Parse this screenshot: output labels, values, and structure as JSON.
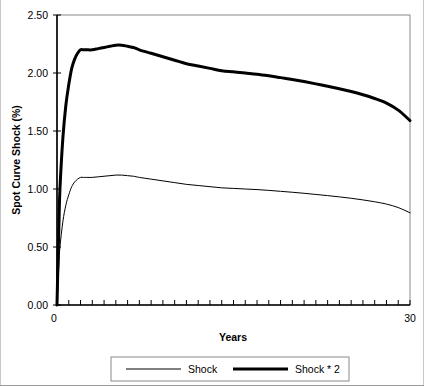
{
  "chart_data": {
    "type": "line",
    "title": "",
    "xlabel": "Years",
    "ylabel": "Spot Curve Shock (%)",
    "xlim": [
      0,
      30
    ],
    "ylim": [
      0,
      2.5
    ],
    "xticklabels": [
      "0",
      "30"
    ],
    "yticklabels": [
      "0.00",
      "0.50",
      "1.00",
      "1.50",
      "2.00",
      "2.50"
    ],
    "ytickvalues": [
      0,
      0.5,
      1.0,
      1.5,
      2.0,
      2.5
    ],
    "grid": false,
    "legend_position": "bottom",
    "x_minor_tick_interval": 1,
    "x": [
      0,
      0.08,
      0.17,
      0.25,
      0.5,
      0.75,
      1,
      1.25,
      1.5,
      1.75,
      2,
      2.25,
      2.5,
      3,
      3.5,
      4,
      4.5,
      5,
      5.5,
      6,
      6.5,
      7,
      8,
      9,
      10,
      11,
      12,
      13,
      14,
      15,
      16,
      17,
      18,
      19,
      20,
      21,
      22,
      23,
      24,
      25,
      26,
      27,
      28,
      29,
      30
    ],
    "series": [
      {
        "name": "Shock",
        "linewidth": 1,
        "color": "#000000",
        "values": [
          0.0,
          0.18,
          0.36,
          0.5,
          0.72,
          0.86,
          0.95,
          1.02,
          1.06,
          1.085,
          1.1,
          1.1,
          1.1,
          1.1,
          1.105,
          1.11,
          1.115,
          1.12,
          1.12,
          1.115,
          1.11,
          1.1,
          1.085,
          1.07,
          1.055,
          1.04,
          1.03,
          1.02,
          1.01,
          1.005,
          1.0,
          0.995,
          0.988,
          0.98,
          0.972,
          0.963,
          0.953,
          0.943,
          0.932,
          0.92,
          0.906,
          0.89,
          0.87,
          0.84,
          0.795
        ]
      },
      {
        "name": "Shock * 2",
        "linewidth": 3,
        "color": "#000000",
        "values": [
          0.0,
          0.36,
          0.72,
          1.0,
          1.44,
          1.72,
          1.9,
          2.04,
          2.12,
          2.17,
          2.2,
          2.2,
          2.2,
          2.2,
          2.21,
          2.22,
          2.23,
          2.24,
          2.24,
          2.23,
          2.22,
          2.2,
          2.17,
          2.14,
          2.11,
          2.08,
          2.06,
          2.04,
          2.02,
          2.01,
          2.0,
          1.99,
          1.976,
          1.96,
          1.944,
          1.926,
          1.906,
          1.886,
          1.864,
          1.84,
          1.812,
          1.78,
          1.74,
          1.68,
          1.59
        ]
      }
    ],
    "legend": [
      {
        "label": "Shock",
        "style": "thin-line"
      },
      {
        "label": "Shock * 2",
        "style": "thick-line"
      }
    ]
  },
  "colors": {
    "axis": "#000000",
    "plot_border": "#8a8a8a",
    "legend_border": "#8a8a8a",
    "background": "#ffffff"
  }
}
